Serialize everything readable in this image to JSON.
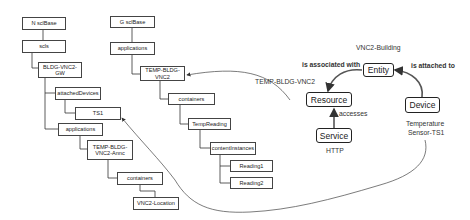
{
  "tree_n": {
    "root": "N sclBase",
    "scls": "scls",
    "gateway": "BLDG-VNC2-GW",
    "attached_devices": "attachedDevices",
    "ts1": "TS1",
    "applications": "applications",
    "annc": "TEMP-BLDG-VNC2-Annc",
    "containers": "containers",
    "location": "VNC2-Location"
  },
  "tree_g": {
    "root": "G sclBase",
    "applications": "applications",
    "app": "TEMP-BLDG-VNC2",
    "containers": "containers",
    "temp_reading": "TempReading",
    "content_instances": "contentInstances",
    "reading1": "Reading1",
    "reading2": "Reading2"
  },
  "model": {
    "entity": "Entity",
    "entity_caption": "VNC2-Building",
    "resource": "Resource",
    "resource_caption": "TEMP-BLDG-VNC2",
    "service": "Service",
    "service_caption": "HTTP",
    "device": "Device",
    "device_caption_line1": "Temperature",
    "device_caption_line2": "Sensor-TS1",
    "rel_associated": "is associated with",
    "rel_attached": "is attached to",
    "rel_accesses": "accesses"
  }
}
